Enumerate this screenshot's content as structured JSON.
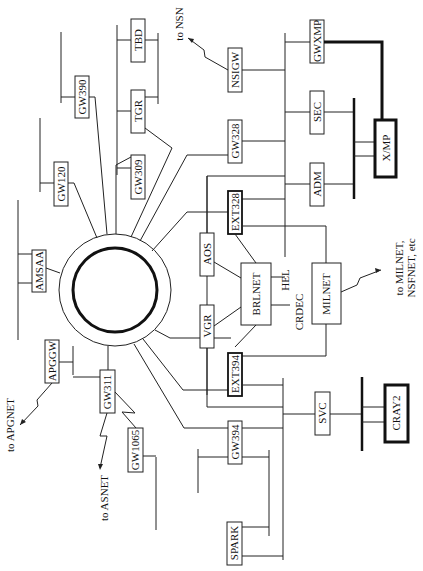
{
  "diagram": {
    "title": "",
    "orientation": "rotated 90 degrees counter-clockwise",
    "ring": {
      "label": ""
    },
    "nodes": {
      "amsaa": "AMSAA",
      "gw120": "GW120",
      "gw390": "GW390",
      "gw309": "GW309",
      "tgr": "TGR",
      "tbd": "TBD",
      "nsigw": "NSIGW",
      "gw328": "GW328",
      "ext328": "EXT328",
      "aos": "AOS",
      "gwxmp": "GWXMP",
      "sec": "SEC",
      "adm": "ADM",
      "xmp": "X/MP",
      "brlnet": "BRLNET",
      "hel": "HEL",
      "crdec": "CRDEC",
      "milnet": "MILNET",
      "vgr": "VGR",
      "ext394": "EXT394",
      "apggw": "APGGW",
      "gw311": "GW311",
      "gw1065": "GW1065",
      "gw394": "GW394",
      "svc": "SVC",
      "cray2": "CRAY2",
      "spark": "SPARK"
    },
    "external_links": {
      "nsn": "to NSN",
      "milnet_line1": "to MILNET,",
      "milnet_line2": "NSFNET, etc",
      "apgnet": "to APGNET",
      "asnet": "to ASNET"
    }
  }
}
